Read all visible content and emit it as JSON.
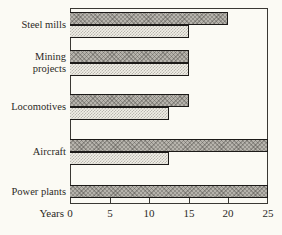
{
  "chart_data": {
    "type": "bar",
    "orientation": "horizontal",
    "title": "",
    "xlabel": "Years",
    "xlim": [
      0,
      25
    ],
    "x_ticks": [
      0,
      5,
      10,
      15,
      20,
      25
    ],
    "grid": false,
    "legend": "none",
    "categories": [
      "Steel mills",
      "Mining projects",
      "Locomotives",
      "Aircraft",
      "Power plants"
    ],
    "series": [
      {
        "name": "upper-dark-crosshatch-bar",
        "values": [
          20,
          15,
          15,
          25,
          25
        ]
      },
      {
        "name": "lower-light-stipple-bar",
        "values": [
          15,
          15,
          12.5,
          12.5,
          null
        ]
      }
    ]
  },
  "colors": {
    "paper": "#fbfaf4",
    "axis_line": "#3a3833",
    "text": "#2b2925",
    "dark_bar_fill": "#b6b3ac",
    "light_bar_fill": "#f1efe7",
    "bar_border": "#1c1a18"
  }
}
